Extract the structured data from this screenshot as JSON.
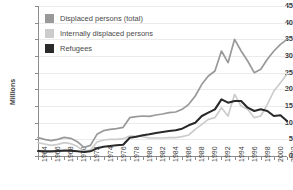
{
  "chart_data": {
    "type": "line",
    "title": "",
    "subtitle": "",
    "xlabel": "",
    "ylabel": "Millions",
    "ylim": [
      0,
      45
    ],
    "xlim": [
      1964,
      2002
    ],
    "grid": true,
    "legend_position": "top-left",
    "y_ticks": [
      0,
      5,
      10,
      15,
      20,
      25,
      30,
      35,
      40,
      45
    ],
    "x_ticks": [
      1964,
      1966,
      1968,
      1970,
      1972,
      1974,
      1976,
      1978,
      1980,
      1982,
      1984,
      1986,
      1988,
      1990,
      1992,
      1994,
      1996,
      1998,
      2000,
      2002
    ],
    "x": [
      1964,
      1965,
      1966,
      1967,
      1968,
      1969,
      1970,
      1971,
      1972,
      1973,
      1974,
      1975,
      1976,
      1977,
      1978,
      1979,
      1980,
      1981,
      1982,
      1983,
      1984,
      1985,
      1986,
      1987,
      1988,
      1989,
      1990,
      1991,
      1992,
      1993,
      1994,
      1995,
      1996,
      1997,
      1998,
      1999,
      2000,
      2001,
      2002
    ],
    "series": [
      {
        "name": "Displaced persons (total)",
        "color": "#999999",
        "values": [
          5.5,
          5.0,
          4.6,
          5.0,
          5.6,
          5.3,
          4.3,
          2.6,
          3.2,
          6.5,
          7.6,
          8.0,
          8.2,
          8.6,
          11.5,
          11.8,
          12.0,
          11.9,
          12.3,
          12.6,
          13.0,
          13.2,
          14.0,
          15.5,
          18.0,
          21.5,
          24.0,
          25.5,
          31.5,
          28.0,
          35.0,
          31.5,
          28.5,
          25.0,
          26.0,
          29.0,
          31.5,
          33.5,
          35.0
        ]
      },
      {
        "name": "Internally displaced persons",
        "color": "#cccccc",
        "values": [
          4.0,
          3.6,
          3.2,
          3.5,
          4.0,
          3.7,
          2.9,
          1.4,
          1.8,
          4.2,
          4.8,
          5.0,
          5.0,
          5.2,
          6.0,
          6.0,
          5.8,
          5.4,
          5.4,
          5.4,
          5.5,
          5.5,
          5.8,
          6.3,
          8.0,
          9.5,
          11.0,
          11.5,
          14.5,
          12.0,
          18.5,
          15.0,
          14.0,
          11.5,
          12.0,
          15.5,
          19.5,
          22.0,
          24.5
        ]
      },
      {
        "name": "Refugees",
        "color": "#2a2a2a",
        "values": [
          1.5,
          1.4,
          1.4,
          1.5,
          1.6,
          1.6,
          1.4,
          1.2,
          1.4,
          2.3,
          2.8,
          3.0,
          3.2,
          3.4,
          5.5,
          5.8,
          6.2,
          6.5,
          6.9,
          7.2,
          7.5,
          7.7,
          8.2,
          9.2,
          10.0,
          12.0,
          13.0,
          14.0,
          17.0,
          16.0,
          16.5,
          16.5,
          14.5,
          13.5,
          14.0,
          13.5,
          12.0,
          12.2,
          10.5
        ]
      }
    ]
  },
  "legend": {
    "items": [
      {
        "label": "Displaced persons (total)",
        "color": "#999999"
      },
      {
        "label": "Internally displaced persons",
        "color": "#cccccc"
      },
      {
        "label": "Refugees",
        "color": "#2a2a2a"
      }
    ]
  },
  "axis": {
    "y_title": "Millions"
  }
}
